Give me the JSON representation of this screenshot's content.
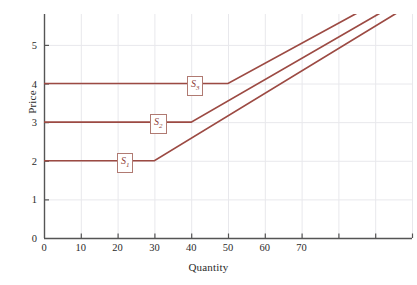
{
  "chart_data": {
    "type": "line",
    "title": "",
    "xlabel": "Quantity",
    "ylabel": "Price",
    "xlim": [
      0,
      100
    ],
    "ylim": [
      0,
      5.8
    ],
    "grid": true,
    "legend": "inline-labels",
    "xticks": [
      0,
      10,
      20,
      30,
      40,
      50,
      60,
      70,
      80,
      90,
      100
    ],
    "xtick_labels": [
      "0",
      "10",
      "20",
      "30",
      "40",
      "50",
      "60",
      "70",
      "",
      "",
      ""
    ],
    "yticks": [
      0,
      1,
      2,
      3,
      4,
      5
    ],
    "ytick_labels": [
      "0",
      "1",
      "2",
      "3",
      "4",
      "5"
    ],
    "line_color": "#9c4a43",
    "grid_color": "#e8e8ec",
    "axis_color": "#555555",
    "series": [
      {
        "name": "S1",
        "label": "S",
        "subscript": "1",
        "label_x": 22,
        "label_y": 2,
        "flat_price": 2,
        "kink_quantity": 30,
        "points": [
          [
            0,
            2
          ],
          [
            30,
            2
          ],
          [
            98,
            5.95
          ]
        ]
      },
      {
        "name": "S2",
        "label": "S",
        "subscript": "2",
        "label_x": 31,
        "label_y": 3,
        "flat_price": 3,
        "kink_quantity": 40,
        "points": [
          [
            0,
            3
          ],
          [
            40,
            3
          ],
          [
            100,
            6.3
          ]
        ]
      },
      {
        "name": "S3",
        "label": "S",
        "subscript": "3",
        "label_x": 41,
        "label_y": 4,
        "flat_price": 4,
        "kink_quantity": 50,
        "points": [
          [
            0,
            4
          ],
          [
            50,
            4
          ],
          [
            100,
            6.6
          ]
        ]
      }
    ]
  },
  "axes": {
    "y_title": "Price",
    "x_title": "Quantity"
  },
  "ticks": {
    "x": [
      "0",
      "10",
      "20",
      "30",
      "40",
      "50",
      "60",
      "70"
    ],
    "y": [
      "0",
      "1",
      "2",
      "3",
      "4",
      "5"
    ]
  },
  "labels": {
    "s1": "S",
    "s1_sub": "1",
    "s2": "S",
    "s2_sub": "2",
    "s3": "S",
    "s3_sub": "3"
  }
}
